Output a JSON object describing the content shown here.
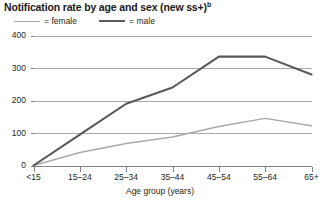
{
  "chart_data": {
    "type": "line",
    "title": "Notification rate by age and sex (new ss+)",
    "title_superscript": "b",
    "xlabel": "Age group (years)",
    "ylabel": "",
    "categories": [
      "<15",
      "15–24",
      "25–34",
      "35–44",
      "45–54",
      "55–64",
      "65+"
    ],
    "series": [
      {
        "name": "female",
        "color": "#a7a9ac",
        "values": [
          0,
          40,
          68,
          88,
          120,
          145,
          122
        ]
      },
      {
        "name": "male",
        "color": "#58595b",
        "values": [
          0,
          95,
          190,
          240,
          335,
          335,
          280
        ]
      }
    ],
    "ylim": [
      0,
      400
    ],
    "yticks": [
      0,
      100,
      200,
      300,
      400
    ],
    "ytick_labels": [
      "0",
      "100",
      "200",
      "300",
      "400"
    ],
    "grid": true,
    "grid_axis": "y",
    "legend": [
      "= female",
      "= male"
    ],
    "legend_position": "top-left"
  },
  "legend": {
    "female": {
      "eq": "=",
      "label": "female"
    },
    "male": {
      "eq": "=",
      "label": "male"
    }
  }
}
